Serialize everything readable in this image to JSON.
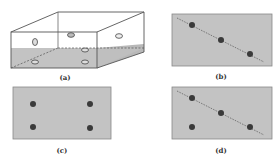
{
  "colors": {
    "fill": "#c3c3c3",
    "stroke": "#555555",
    "dot": "#3a3a3a",
    "box_face": "#ffffff"
  },
  "panels": [
    {
      "id": "a",
      "label": "(a)",
      "description": "3D box partially filled, with elliptical holes/markers on faces"
    },
    {
      "id": "b",
      "label": "(b)",
      "description": "Three collinear dots on a dashed diagonal line"
    },
    {
      "id": "c",
      "label": "(c)",
      "description": "Four dots at rectangle corners"
    },
    {
      "id": "d",
      "label": "(d)",
      "description": "Three dots on dashed diagonal line plus one off-line dot"
    }
  ]
}
